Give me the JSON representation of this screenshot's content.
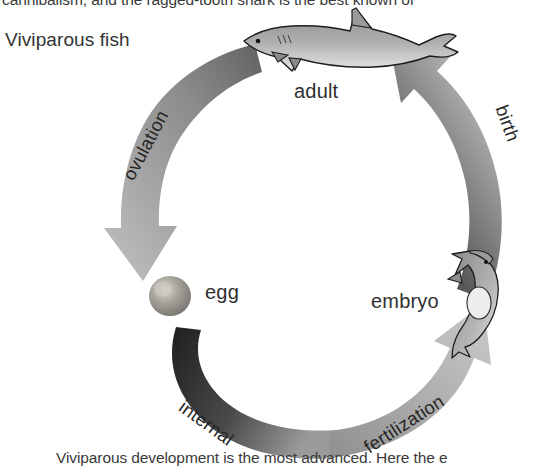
{
  "page": {
    "background_color": "#ffffff",
    "text_above_figure": "cannibalism, and the ragged-tooth shark is the best known of",
    "text_below_figure": "Viviparous development is the most advanced. Here the e"
  },
  "figure": {
    "heading": "Viviparous fish",
    "type": "cycle-diagram",
    "nodes": [
      {
        "id": "adult",
        "label": "adult",
        "icon": "adult-shark-illustration",
        "position": "top"
      },
      {
        "id": "embryo",
        "label": "embryo",
        "icon": "embryo-shark-illustration",
        "position": "right"
      },
      {
        "id": "egg",
        "label": "egg",
        "icon": "egg-sphere-illustration",
        "position": "left"
      }
    ],
    "arrows": [
      {
        "id": "ovulation",
        "label": "ovulation",
        "from": "adult",
        "to": "egg",
        "color_start": "#6e6e6e",
        "color_end": "#b9b9b9"
      },
      {
        "id": "internal",
        "label": "internal",
        "from": "egg",
        "to": "middle",
        "color_start": "#242424",
        "color_end": "#8f8f8f"
      },
      {
        "id": "fertilization",
        "label": "fertilization",
        "from": "middle",
        "to": "embryo",
        "color_start": "#9b9b9b",
        "color_end": "#c6c6c6"
      },
      {
        "id": "birth",
        "label": "birth",
        "from": "embryo",
        "to": "adult",
        "color_start": "#3a3a3a",
        "color_end": "#cfcfcf"
      }
    ],
    "colors": {
      "text": "#2f2f2f",
      "arrow_dark": "#242424",
      "arrow_light": "#cfcfcf",
      "egg": "#8a8a8a",
      "shark_body": "#a9a9a9",
      "shark_outline": "#1e1e1e"
    }
  }
}
